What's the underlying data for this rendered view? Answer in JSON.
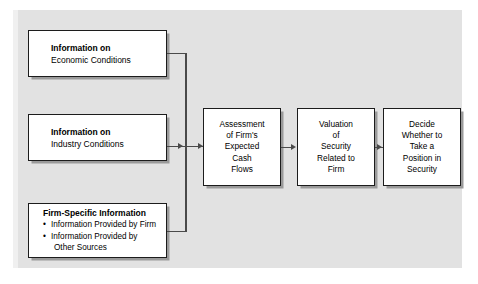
{
  "diagram": {
    "panel_color": "#e2e2e2",
    "box_border_color": "#1c1c1c",
    "box_fill_color": "#ffffff",
    "connector_color": "#4a4a4a",
    "inputs": [
      {
        "id": "economic",
        "title": "Information on",
        "subtitle": "Economic Conditions"
      },
      {
        "id": "industry",
        "title": "Information on",
        "subtitle": "Industry Conditions"
      },
      {
        "id": "firm",
        "title": "Firm-Specific Information",
        "bullets": [
          {
            "text": "Information Provided by Firm",
            "continuation": ""
          },
          {
            "text": "Information Provided by",
            "continuation": "Other Sources"
          }
        ]
      }
    ],
    "chain": [
      {
        "id": "assessment",
        "lines": [
          "Assessment",
          "of Firm's",
          "Expected",
          "Cash",
          "Flows"
        ]
      },
      {
        "id": "valuation",
        "lines": [
          "Valuation",
          "of",
          "Security",
          "Related to",
          "Firm"
        ]
      },
      {
        "id": "decide",
        "lines": [
          "Decide",
          "Whether to",
          "Take a",
          "Position in",
          "Security"
        ]
      }
    ]
  }
}
